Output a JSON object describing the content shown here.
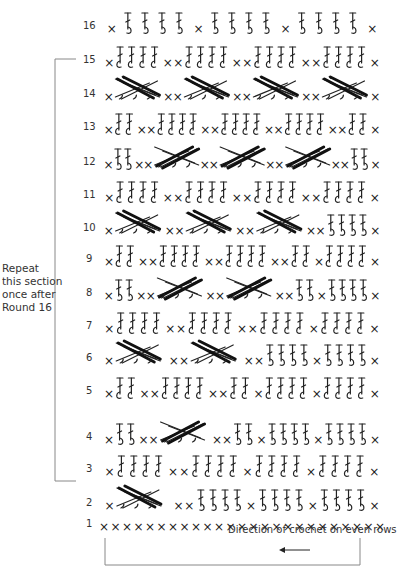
{
  "repeat_note": [
    "Repeat",
    "this section",
    "once after",
    "Round 16"
  ],
  "direction_note": "Direction of crochet on even rows",
  "direction_arrow": "left",
  "repeat_bracket_rows": [
    3,
    15
  ],
  "rows": [
    {
      "n": 16,
      "pattern": "xCCCCxx",
      "tail": "S4xS4xS4x",
      "type": "cross"
    },
    {
      "n": 15,
      "pattern": "x",
      "tail": "T4xxT4xxT4xxT4x",
      "type": "plain"
    },
    {
      "n": 14,
      "pattern": "x",
      "tail": "CCxxCCxxCCxxCCx",
      "type": "cross4"
    },
    {
      "n": 13,
      "pattern": "x",
      "tail": "T2xxT4xxT4xxT4xxT2x",
      "type": "plain"
    },
    {
      "n": 12,
      "pattern": "x",
      "tail": "S2xxCCxxCCxxCCxxS2x",
      "type": "crossR"
    },
    {
      "n": 11,
      "pattern": "x",
      "tail": "T4xxT4xxT4xxT4x",
      "type": "plain"
    },
    {
      "n": 10,
      "pattern": "x",
      "tail": "CCxxCCxxCCxxS4x",
      "type": "cross3"
    },
    {
      "n": 9,
      "pattern": "x",
      "tail": "T2xxT4xxT4xxT2xT4x",
      "type": "plain"
    },
    {
      "n": 8,
      "pattern": "x",
      "tail": "S2xxCCxxCCxxS2xS4x",
      "type": "crossR2"
    },
    {
      "n": 7,
      "pattern": "x",
      "tail": "T4xxT4xxT4xT4x",
      "type": "plain"
    },
    {
      "n": 6,
      "pattern": "x",
      "tail": "CCxxCCxxS4xS4x",
      "type": "cross2"
    },
    {
      "n": 5,
      "pattern": "x",
      "tail": "T2xxT4xxT2xT4xT4x",
      "type": "plain"
    },
    {
      "n": 4,
      "pattern": "x",
      "tail": "S2xxCCxxS2xS4xS4x",
      "type": "crossR1"
    },
    {
      "n": 3,
      "pattern": "x",
      "tail": "T4xxT4xT4xT4x",
      "type": "plain"
    },
    {
      "n": 2,
      "pattern": "x",
      "tail": "CCxxS4xS4xS4x",
      "type": "cross1"
    },
    {
      "n": 1,
      "pattern": "xxxxxxxxxxxxxxxxxxxxxxxxx",
      "tail": "",
      "type": "chain"
    }
  ],
  "colors": {
    "ink": "#222222",
    "background": "#ffffff",
    "bracket": "#888888"
  }
}
